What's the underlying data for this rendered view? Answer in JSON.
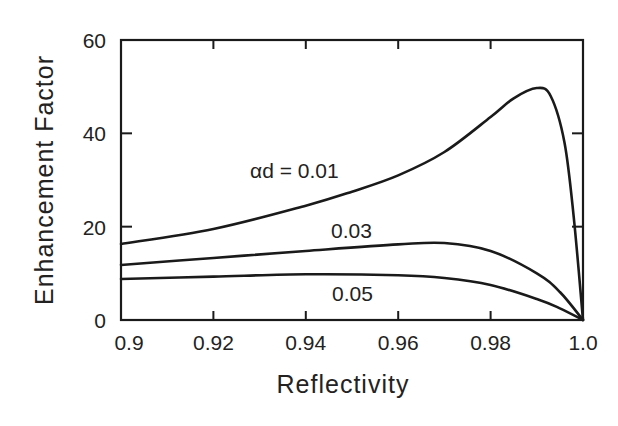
{
  "chart_data": {
    "type": "line",
    "title": "",
    "xlabel": "Reflectivity",
    "ylabel": "Enhancement Factor",
    "xlim": [
      0.9,
      1.0
    ],
    "ylim": [
      0,
      60
    ],
    "grid": false,
    "legend": "none (inline curve labels)",
    "x_ticks": [
      0.9,
      0.92,
      0.94,
      0.96,
      0.98,
      1.0
    ],
    "x_tick_labels": [
      "0.9",
      "0.92",
      "0.94",
      "0.96",
      "0.98",
      "1.0"
    ],
    "y_ticks": [
      0,
      20,
      40,
      60
    ],
    "y_tick_labels": [
      "0",
      "20",
      "40",
      "60"
    ],
    "annotations": [
      {
        "text": "αd = 0.01",
        "series": "0.01"
      },
      {
        "text": "0.03",
        "series": "0.03"
      },
      {
        "text": "0.05",
        "series": "0.05"
      }
    ],
    "series": [
      {
        "name": "αd = 0.01",
        "x": [
          0.9,
          0.92,
          0.94,
          0.95,
          0.96,
          0.97,
          0.98,
          0.985,
          0.99,
          0.993,
          0.996,
          0.998,
          1.0
        ],
        "y": [
          16.3,
          19.5,
          24.5,
          27.5,
          31,
          36,
          43.5,
          47.5,
          49.7,
          48,
          38,
          22,
          0
        ]
      },
      {
        "name": "0.03",
        "x": [
          0.9,
          0.92,
          0.94,
          0.96,
          0.97,
          0.98,
          0.99,
          0.995,
          1.0
        ],
        "y": [
          11.8,
          13.3,
          14.8,
          16.2,
          16.5,
          14.8,
          10,
          6,
          0
        ]
      },
      {
        "name": "0.05",
        "x": [
          0.9,
          0.92,
          0.94,
          0.96,
          0.97,
          0.98,
          0.99,
          0.995,
          1.0
        ],
        "y": [
          8.8,
          9.3,
          9.8,
          9.6,
          9.0,
          7.5,
          4.5,
          2.5,
          0
        ]
      }
    ]
  }
}
